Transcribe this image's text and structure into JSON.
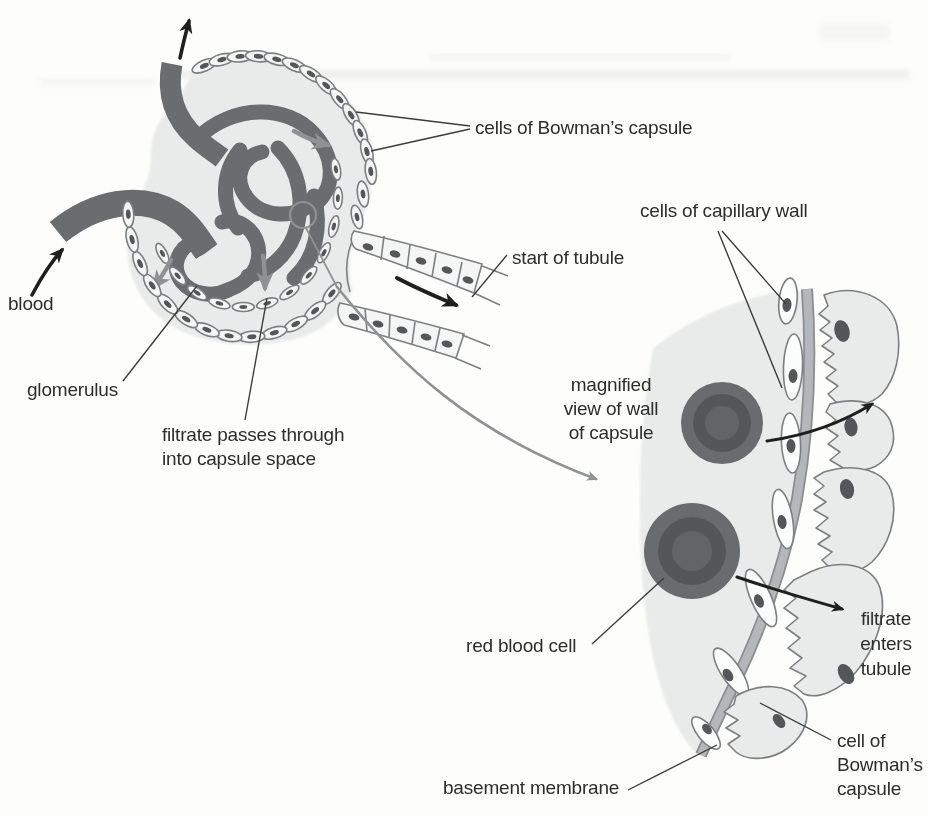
{
  "labels": {
    "blood": "blood",
    "glomerulus": "glomerulus",
    "cells_of_bowmans_capsule": "cells of Bowman’s capsule",
    "start_of_tubule": "start of tubule",
    "filtrate_passes_line1": "filtrate passes through",
    "filtrate_passes_line2": "into capsule space",
    "cells_of_capillary_wall": "cells of capillary wall",
    "magnified_line1": "magnified",
    "magnified_line2": "view of wall",
    "magnified_line3": "of capsule",
    "red_blood_cell": "red blood cell",
    "filtrate_enters_line1": "filtrate",
    "filtrate_enters_line2": "enters",
    "filtrate_enters_line3": "tubule",
    "cell_of_bowmans_line1": "cell of",
    "cell_of_bowmans_line2": "Bowman’s",
    "cell_of_bowmans_line3": "capsule",
    "basement_membrane": "basement membrane"
  },
  "colors": {
    "background": "#fdfdfc",
    "blood_vessel": "#6a6d6f",
    "capsule_space": "#e9eaea",
    "cell_fill": "#f4f5f4",
    "capillary_cell_fill": "#fbfcfc",
    "cell_outline": "#7c7f81",
    "nucleus": "#54575a",
    "rbc_outer": "#696c6e",
    "rbc_ring": "#54575a",
    "rbc_center": "#626567",
    "basement_membrane": "#b4b7b9",
    "basement_membrane_edge": "#8a8d8f",
    "podocyte_fill": "#e9eaea",
    "flow_arrow_gray": "#8f9294",
    "arrow_black": "#1f1f1f",
    "label_text": "#2d2d2d",
    "leader_line": "#3c3c3c"
  }
}
